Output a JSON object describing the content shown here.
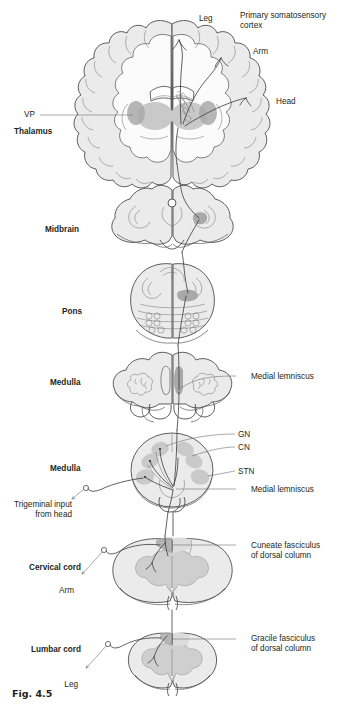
{
  "figure": {
    "caption": "Fig. 4.5"
  },
  "colors": {
    "outline": "#4d4d4d",
    "outline_dark": "#333333",
    "cortex_fill": "#ebebeb",
    "white_matter": "#fafafa",
    "nucleus_fill": "#c9c9c9",
    "nucleus_fill_dark": "#a8a8a8",
    "gray_matter": "#cfcfcf",
    "tract_dark": "#8a8a8a",
    "leader": "#6e6e6e",
    "text": "#231f20"
  },
  "labels": {
    "leg_cortex": "Leg",
    "primary_cortex_line1": "Primary somatosensory",
    "primary_cortex_line2": "cortex",
    "arm_cortex": "Arm",
    "head_cortex": "Head",
    "vp": "VP",
    "thalamus": "Thalamus",
    "midbrain": "Midbrain",
    "pons": "Pons",
    "medulla_upper": "Medulla",
    "medial_lemniscus_upper": "Medial lemniscus",
    "gn": "GN",
    "cn": "CN",
    "stn": "STN",
    "medulla_lower": "Medulla",
    "medial_lemniscus_lower": "Medial lemniscus",
    "trigeminal_line1": "Trigeminal input",
    "trigeminal_line2": "from head",
    "cervical_cord": "Cervical cord",
    "arm_cord": "Arm",
    "cuneate_line1": "Cuneate fasciculus",
    "cuneate_line2": "of dorsal column",
    "lumbar_cord": "Lumbar cord",
    "leg_cord": "Leg",
    "gracile_line1": "Gracile fasciculus",
    "gracile_line2": "of dorsal column"
  },
  "sections": [
    {
      "name": "cerebrum-coronal",
      "label": "Thalamus"
    },
    {
      "name": "midbrain",
      "label": "Midbrain"
    },
    {
      "name": "pons",
      "label": "Pons"
    },
    {
      "name": "medulla-upper",
      "label": "Medulla"
    },
    {
      "name": "medulla-lower",
      "label": "Medulla"
    },
    {
      "name": "cervical-cord",
      "label": "Cervical cord"
    },
    {
      "name": "lumbar-cord",
      "label": "Lumbar cord"
    }
  ]
}
